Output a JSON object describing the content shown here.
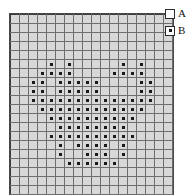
{
  "figure": {
    "type": "grid-pattern-diagram"
  },
  "grid": {
    "columns": 18,
    "rows": 20,
    "cell_size_px": 8,
    "empty_cell_color": "#d8d8d8",
    "grid_line_color": "#6e6e6e",
    "border_color": "#4a4a4a",
    "marker_color": "#1a1a1a",
    "marker_shape": "square-dot",
    "marked_cells": [
      [
        5,
        4
      ],
      [
        5,
        6
      ],
      [
        5,
        12
      ],
      [
        5,
        14
      ],
      [
        6,
        3
      ],
      [
        6,
        4
      ],
      [
        6,
        5
      ],
      [
        6,
        6
      ],
      [
        6,
        11
      ],
      [
        6,
        12
      ],
      [
        6,
        13
      ],
      [
        6,
        14
      ],
      [
        7,
        2
      ],
      [
        7,
        3
      ],
      [
        7,
        5
      ],
      [
        7,
        6
      ],
      [
        7,
        7
      ],
      [
        7,
        8
      ],
      [
        7,
        9
      ],
      [
        7,
        14
      ],
      [
        7,
        15
      ],
      [
        8,
        2
      ],
      [
        8,
        3
      ],
      [
        8,
        5
      ],
      [
        8,
        6
      ],
      [
        8,
        7
      ],
      [
        8,
        8
      ],
      [
        8,
        9
      ],
      [
        8,
        14
      ],
      [
        8,
        15
      ],
      [
        9,
        2
      ],
      [
        9,
        3
      ],
      [
        9,
        4
      ],
      [
        9,
        5
      ],
      [
        9,
        6
      ],
      [
        9,
        7
      ],
      [
        9,
        8
      ],
      [
        9,
        9
      ],
      [
        9,
        10
      ],
      [
        9,
        11
      ],
      [
        9,
        12
      ],
      [
        9,
        13
      ],
      [
        9,
        14
      ],
      [
        9,
        15
      ],
      [
        10,
        3
      ],
      [
        10,
        4
      ],
      [
        10,
        5
      ],
      [
        10,
        6
      ],
      [
        10,
        7
      ],
      [
        10,
        8
      ],
      [
        10,
        9
      ],
      [
        10,
        10
      ],
      [
        10,
        11
      ],
      [
        10,
        12
      ],
      [
        10,
        13
      ],
      [
        10,
        14
      ],
      [
        11,
        4
      ],
      [
        11,
        5
      ],
      [
        11,
        6
      ],
      [
        11,
        7
      ],
      [
        11,
        8
      ],
      [
        11,
        9
      ],
      [
        11,
        10
      ],
      [
        11,
        11
      ],
      [
        11,
        12
      ],
      [
        11,
        13
      ],
      [
        12,
        5
      ],
      [
        12,
        6
      ],
      [
        12,
        7
      ],
      [
        12,
        8
      ],
      [
        12,
        9
      ],
      [
        12,
        10
      ],
      [
        12,
        11
      ],
      [
        12,
        12
      ],
      [
        13,
        4
      ],
      [
        13,
        5
      ],
      [
        13,
        6
      ],
      [
        13,
        7
      ],
      [
        13,
        8
      ],
      [
        13,
        9
      ],
      [
        13,
        10
      ],
      [
        13,
        11
      ],
      [
        13,
        12
      ],
      [
        13,
        13
      ],
      [
        14,
        5
      ],
      [
        14,
        7
      ],
      [
        14,
        8
      ],
      [
        14,
        9
      ],
      [
        14,
        10
      ],
      [
        14,
        12
      ],
      [
        15,
        5
      ],
      [
        15,
        8
      ],
      [
        15,
        9
      ],
      [
        15,
        10
      ],
      [
        15,
        12
      ],
      [
        16,
        6
      ],
      [
        16,
        7
      ],
      [
        16,
        8
      ],
      [
        16,
        9
      ],
      [
        16,
        10
      ],
      [
        16,
        11
      ]
    ]
  },
  "legend": {
    "position": "top-right",
    "items": [
      {
        "key": "A",
        "label": "A",
        "swatch": "empty-square",
        "meaning_color": "#ffffff"
      },
      {
        "key": "B",
        "label": "B",
        "swatch": "dotted-square",
        "meaning_color": "#1a1a1a"
      }
    ]
  }
}
